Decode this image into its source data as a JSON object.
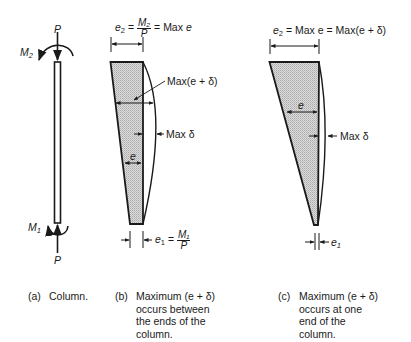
{
  "figure": {
    "panel_a": {
      "load_top": "P",
      "load_bottom": "P",
      "moment_top": "M",
      "moment_top_sub": "2",
      "moment_bottom": "M",
      "moment_bottom_sub": "1",
      "caption_tag": "(a)",
      "caption_text": "Column."
    },
    "panel_b": {
      "e2_symbol": "e",
      "e2_sub": "2",
      "eq1": "=",
      "frac_num": "M₂",
      "frac_den": "P",
      "eq2": "= Max",
      "e_italic": "e",
      "max_e_delta": "Max(e + δ)",
      "max_delta": "Max δ",
      "e_label": "e",
      "e1_symbol": "e",
      "e1_sub": "1",
      "e1_eq": "=",
      "e1_frac_num": "M₁",
      "e1_frac_den": "P",
      "caption_tag": "(b)",
      "caption_text": "Maximum (e + δ)\noccurs between\nthe ends of the\ncolumn."
    },
    "panel_c": {
      "e2_symbol": "e",
      "e2_sub": "2",
      "top_eq": "= Max e = Max(e + δ)",
      "e_label": "e",
      "max_delta": "Max δ",
      "e1_symbol": "e",
      "e1_sub": "1",
      "caption_tag": "(c)",
      "caption_text": "Maximum (e + δ)\noccurs at one\nend of the\ncolumn."
    },
    "colors": {
      "ink": "#1a1a1a",
      "hatch_fill": "#cfcfcf",
      "background": "#ffffff"
    }
  }
}
